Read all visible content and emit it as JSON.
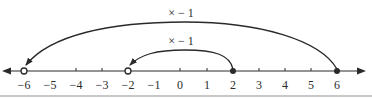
{
  "diagram": {
    "type": "number-line",
    "axis": {
      "min": -6,
      "max": 6,
      "tick_labels": [
        "−6",
        "−5",
        "−4",
        "−3",
        "−2",
        "−1",
        "0",
        "1",
        "2",
        "3",
        "4",
        "5",
        "6"
      ],
      "arrows": "both"
    },
    "points": [
      {
        "value": -6,
        "style": "open"
      },
      {
        "value": -2,
        "style": "open"
      },
      {
        "value": 2,
        "style": "filled"
      },
      {
        "value": 6,
        "style": "filled"
      }
    ],
    "arcs": [
      {
        "from": 6,
        "to": -6,
        "label": "× − 1"
      },
      {
        "from": 2,
        "to": -2,
        "label": "× − 1"
      }
    ],
    "colors": {
      "line": "#2a2a2a",
      "rule": "#c8c8c8"
    }
  }
}
